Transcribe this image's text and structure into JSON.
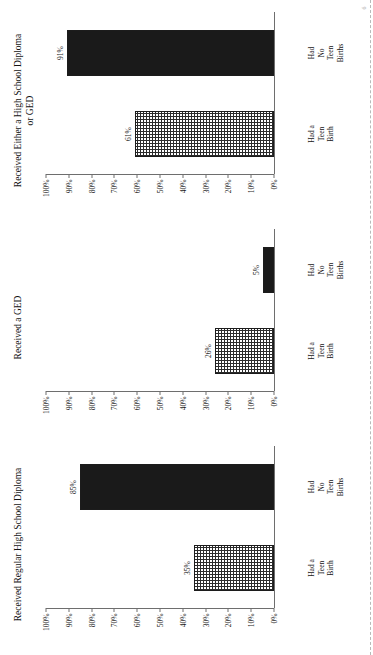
{
  "document": {
    "page_marker": "6"
  },
  "chart_data": [
    {
      "type": "bar",
      "title": "Received Regular High School Diploma",
      "title_line2": "",
      "categories": [
        "Had a Teen Birth",
        "Had No Teen Births"
      ],
      "category_lines": [
        [
          "Had a",
          "Teen",
          "Birth"
        ],
        [
          "Had",
          "No",
          "Teen",
          "Births"
        ]
      ],
      "values": [
        35,
        85
      ],
      "value_labels": [
        "35%",
        "85%"
      ],
      "fills": [
        "hatch",
        "solid"
      ],
      "xlabel": "",
      "ylabel": "",
      "ylim": [
        0,
        100
      ],
      "yticks": [
        100,
        90,
        80,
        70,
        60,
        50,
        40,
        30,
        20,
        10,
        0
      ],
      "ytick_labels": [
        "100%",
        "90%",
        "80%",
        "70%",
        "60%",
        "50%",
        "40%",
        "30%",
        "20%",
        "10%",
        "0%"
      ],
      "grid": false,
      "legend": "none"
    },
    {
      "type": "bar",
      "title": "Received a GED",
      "title_line2": "",
      "categories": [
        "Had a Teen Birth",
        "Had No Teen Births"
      ],
      "category_lines": [
        [
          "Had a",
          "Teen",
          "Birth"
        ],
        [
          "Had",
          "No",
          "Teen",
          "Births"
        ]
      ],
      "values": [
        26,
        5
      ],
      "value_labels": [
        "26%",
        "5%"
      ],
      "fills": [
        "hatch",
        "solid"
      ],
      "xlabel": "",
      "ylabel": "",
      "ylim": [
        0,
        100
      ],
      "yticks": [
        100,
        90,
        80,
        70,
        60,
        50,
        40,
        30,
        20,
        10,
        0
      ],
      "ytick_labels": [
        "100%",
        "90%",
        "80%",
        "70%",
        "60%",
        "50%",
        "40%",
        "30%",
        "20%",
        "10%",
        "0%"
      ],
      "grid": false,
      "legend": "none"
    },
    {
      "type": "bar",
      "title": "Received Either a High School Diploma",
      "title_line2": "or GED",
      "categories": [
        "Had a Teen Birth",
        "Had No Teen Births"
      ],
      "category_lines": [
        [
          "Had a",
          "Teen",
          "Birth"
        ],
        [
          "Had",
          "No",
          "Teen",
          "Births"
        ]
      ],
      "values": [
        61,
        91
      ],
      "value_labels": [
        "61%",
        "91%"
      ],
      "fills": [
        "hatch",
        "solid"
      ],
      "xlabel": "",
      "ylabel": "",
      "ylim": [
        0,
        100
      ],
      "yticks": [
        100,
        90,
        80,
        70,
        60,
        50,
        40,
        30,
        20,
        10,
        0
      ],
      "ytick_labels": [
        "100%",
        "90%",
        "80%",
        "70%",
        "60%",
        "50%",
        "40%",
        "30%",
        "20%",
        "10%",
        "0%"
      ],
      "grid": false,
      "legend": "none"
    }
  ]
}
